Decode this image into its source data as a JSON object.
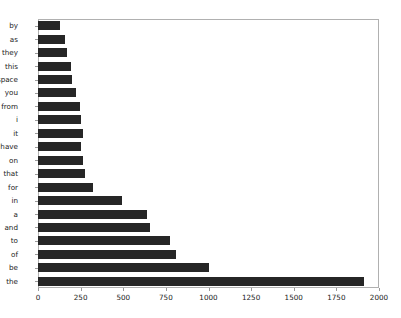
{
  "chart_data": {
    "type": "bar",
    "orientation": "horizontal",
    "title": "",
    "xlabel": "",
    "ylabel": "",
    "xlim": [
      0,
      2000
    ],
    "xticks": [
      0,
      250,
      500,
      750,
      1000,
      1250,
      1500,
      1750,
      2000
    ],
    "grid": false,
    "legend": null,
    "bar_color": "#262626",
    "categories": [
      "by",
      "as",
      "they",
      "this",
      "space",
      "you",
      "from",
      "i",
      "it",
      "have",
      "on",
      "that",
      "for",
      "in",
      "a",
      "and",
      "to",
      "of",
      "be",
      "the"
    ],
    "values": [
      130,
      160,
      170,
      195,
      200,
      220,
      245,
      255,
      262,
      255,
      262,
      275,
      325,
      495,
      640,
      655,
      775,
      810,
      1000,
      1910
    ]
  }
}
